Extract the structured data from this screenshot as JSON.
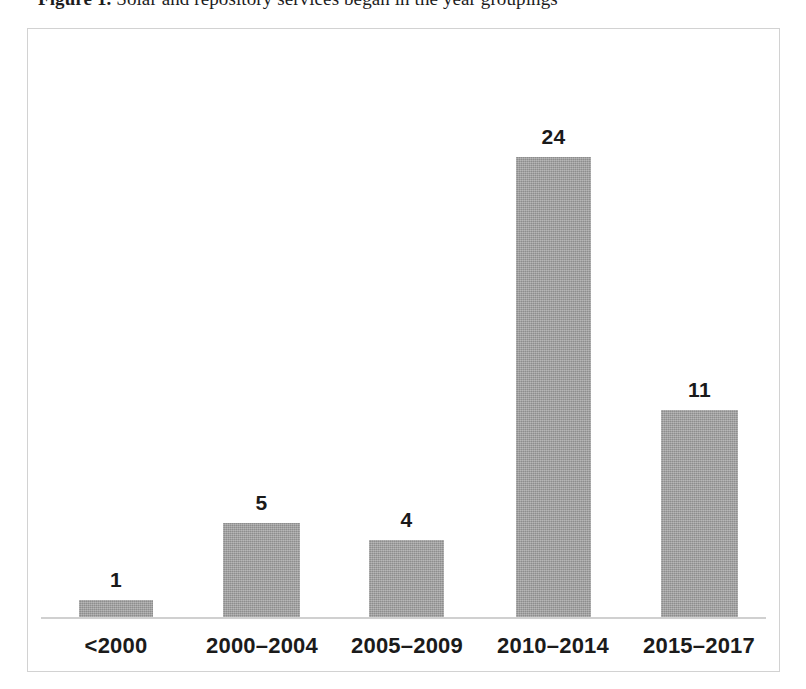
{
  "caption": {
    "prefix": "Figure 1.",
    "rest": " Solar and repository services began in the year groupings"
  },
  "figure": {
    "frame_border_color": "#d2d2d2",
    "axis_line_color": "#d0d0d0",
    "bar_color": "#9b9b9b",
    "label_color": "#1a1a1a",
    "background": "#ffffff"
  },
  "chart_data": {
    "type": "bar",
    "title": "",
    "subtitle": "",
    "xlabel": "",
    "ylabel": "",
    "categories": [
      "<2000",
      "2000–2004",
      "2005–2009",
      "2010–2014",
      "2015–2017"
    ],
    "values": [
      1,
      5,
      4,
      24,
      11
    ],
    "data_labels": [
      "1",
      "5",
      "4",
      "24",
      "11"
    ],
    "series": [
      {
        "name": "Services begun",
        "values": [
          1,
          5,
          4,
          24,
          11
        ]
      }
    ],
    "ylim": [
      0,
      24
    ],
    "grid": false,
    "legend": "none",
    "y_axis_visible": false,
    "x_axis_visible": true,
    "data_labels_visible": true,
    "orientation": "vertical"
  },
  "bars": [
    {
      "category": "<2000",
      "value": 1,
      "label": "1",
      "left": 51,
      "width": 74,
      "height": 17
    },
    {
      "category": "2000–2004",
      "value": 5,
      "label": "5",
      "left": 195,
      "width": 77,
      "height": 94
    },
    {
      "category": "2005–2009",
      "value": 4,
      "label": "4",
      "left": 341,
      "width": 75,
      "height": 77
    },
    {
      "category": "2010–2014",
      "value": 24,
      "label": "24",
      "left": 488,
      "width": 75,
      "height": 460
    },
    {
      "category": "2015–2017",
      "value": 11,
      "label": "11",
      "left": 633,
      "width": 77,
      "height": 207
    }
  ],
  "category_positions": [
    {
      "label": "<2000",
      "left": 33,
      "width": 110
    },
    {
      "label": "2000–2004",
      "left": 163,
      "width": 142
    },
    {
      "label": "2005–2009",
      "left": 308,
      "width": 142
    },
    {
      "label": "2010–2014",
      "left": 454,
      "width": 142
    },
    {
      "label": "2015–2017",
      "left": 600,
      "width": 142
    }
  ]
}
